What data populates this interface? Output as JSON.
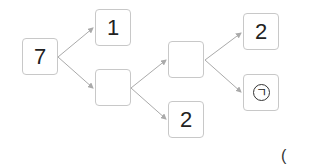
{
  "diagram": {
    "nodes": {
      "root": "7",
      "top_split": "1",
      "middle_split": "",
      "center": "",
      "bottom": "2",
      "right_top": "2",
      "right_bottom": "ㄱ"
    },
    "paren": "("
  }
}
